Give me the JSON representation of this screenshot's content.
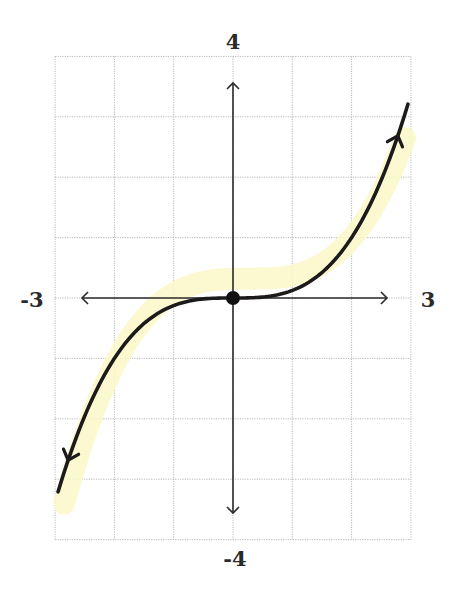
{
  "chart_data": {
    "type": "line",
    "title": "",
    "xlabel": "",
    "ylabel": "",
    "function": "y = x^3 / 8",
    "xlim": [
      -3,
      3
    ],
    "ylim": [
      -4,
      4
    ],
    "grid": true,
    "grid_step": 1,
    "legend": null,
    "tick_labels": {
      "x_min": "-3",
      "x_max": "3",
      "y_max": "4",
      "y_min": "-4"
    },
    "series": [
      {
        "name": "curve",
        "x": [
          -2.95,
          -2.5,
          -2,
          -1.5,
          -1,
          -0.5,
          0,
          0.5,
          1,
          1.5,
          2,
          2.5,
          2.95
        ],
        "y": [
          -3.21,
          -1.95,
          -1.0,
          -0.42,
          -0.125,
          -0.016,
          0,
          0.016,
          0.125,
          0.42,
          1.0,
          1.95,
          3.21
        ],
        "end_arrows": true
      }
    ],
    "annotations": [
      {
        "type": "point",
        "x": 0,
        "y": 0,
        "filled": true,
        "label": ""
      },
      {
        "type": "highlight",
        "color": "#fcf8c8",
        "description": "faint yellow highlighter stroke roughly tracing the curve"
      }
    ]
  },
  "labels": {
    "x_min": "-3",
    "x_max": "3",
    "y_max": "4",
    "y_min": "-4"
  },
  "colors": {
    "curve": "#1c1a1a",
    "axis": "#2a2a2a",
    "grid": "#b8b8b8",
    "highlight": "#fcf8c8",
    "point": "#111111",
    "label": "#2a2a2a"
  },
  "layout": {
    "origin_px": [
      233,
      298
    ],
    "unit_px_x": 59.3,
    "unit_px_y": 60.4,
    "x_axis_arrow_px": [
      82,
      387
    ],
    "y_axis_arrow_px": [
      83,
      513
    ]
  }
}
